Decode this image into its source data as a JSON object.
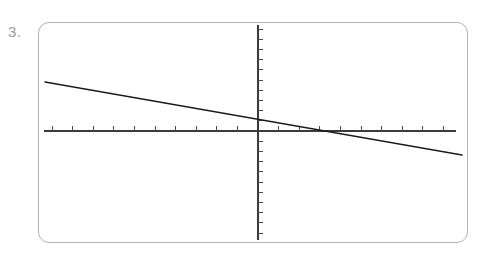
{
  "problem": {
    "number_label": "3."
  },
  "frame": {
    "name": "graphing-calculator-screen",
    "border_color": "#b4b4b4",
    "background_color": "#ffffff",
    "left": 38,
    "top": 22,
    "width": 430,
    "height": 221,
    "corner_radius": 11
  },
  "chart_data": {
    "type": "line",
    "title": "",
    "subtitle": "",
    "xlabel": "",
    "ylabel": "",
    "grid": false,
    "legend": null,
    "legend_position": "none",
    "axis_style": "tick-marked crosshair axes, no numeric labels",
    "line_color": "#1c1c1c",
    "axis_color": "#3b3b3b",
    "xlim": [
      -10.7,
      10.1
    ],
    "ylim": [
      -10.9,
      10.6
    ],
    "x_tick_step": 1,
    "y_tick_step": 1,
    "x_tick_count": 20,
    "y_tick_count": 21,
    "series": [
      {
        "name": "line",
        "description": "decreasing straight line with negative slope crossing x-axis right of origin",
        "x": [
          -10.2,
          10.0
        ],
        "y": [
          2.45,
          -1.18
        ],
        "slope": -0.18,
        "y_intercept": 0.62,
        "x_intercept": 3.45,
        "points_px": [
          {
            "x": 45,
            "y": 82
          },
          {
            "x": 462,
            "y": 155
          }
        ]
      }
    ],
    "annotations": []
  },
  "geometry": {
    "x_axis": {
      "y": 131,
      "x_start": 44,
      "x_end": 456
    },
    "y_axis": {
      "x": 258,
      "y_start": 25,
      "y_end": 240
    },
    "x_tick_spacing_px": 20.6,
    "y_tick_spacing_px": 10.2,
    "x_tick_length_px": 5,
    "y_tick_length_px": 5
  }
}
